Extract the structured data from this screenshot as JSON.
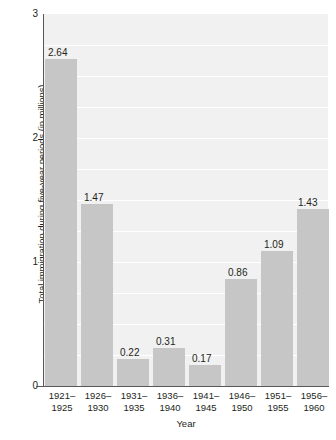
{
  "chart_data": {
    "type": "bar",
    "title": "",
    "xlabel": "Year",
    "ylabel": "Total immigration during five-year periods (in millions)",
    "categories": [
      "1921–1925",
      "1926–1930",
      "1931–1935",
      "1936–1940",
      "1941–1945",
      "1946–1950",
      "1951–1955",
      "1956–1960"
    ],
    "category_lines": [
      [
        "1921–",
        "1925"
      ],
      [
        "1926–",
        "1930"
      ],
      [
        "1931–",
        "1935"
      ],
      [
        "1936–",
        "1940"
      ],
      [
        "1941–",
        "1945"
      ],
      [
        "1946–",
        "1950"
      ],
      [
        "1951–",
        "1955"
      ],
      [
        "1956–",
        "1960"
      ]
    ],
    "values": [
      2.64,
      1.47,
      0.22,
      0.31,
      0.17,
      0.86,
      1.09,
      1.43
    ],
    "value_labels": [
      "2.64",
      "1.47",
      "0.22",
      "0.31",
      "0.17",
      "0.86",
      "1.09",
      "1.43"
    ],
    "ylim": [
      0,
      3
    ],
    "ytick_labels": [
      "0",
      "1",
      "2",
      "3"
    ],
    "ytick_values": [
      0,
      1,
      2,
      3
    ],
    "grid": true,
    "gridline_interval": 0.25,
    "legend": "none",
    "colors": {
      "bar_fill": "#c6c6c6",
      "plot_background": "#f1f1f1",
      "gridline": "#ffffff",
      "axis_line": "#58585a",
      "text": "#231f20",
      "page_background": "#ffffff"
    }
  }
}
